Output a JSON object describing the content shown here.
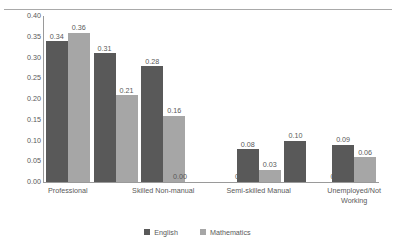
{
  "chart_data": {
    "type": "bar",
    "title": "",
    "subtitle": "",
    "xlabel": "",
    "ylabel": "",
    "ylim": [
      0.0,
      0.4
    ],
    "ytick_step": 0.05,
    "ytick_labels": [
      "0.40",
      "0.35",
      "0.30",
      "0.25",
      "0.20",
      "0.15",
      "0.10",
      "0.05",
      "0.00"
    ],
    "ytick_values": [
      0.4,
      0.35,
      0.3,
      0.25,
      0.2,
      0.15,
      0.1,
      0.05,
      0.0
    ],
    "grid": false,
    "legend_position": "bottom",
    "categories": [
      "Professional",
      "",
      "Skilled Non-manual",
      "",
      "Semi-skilled Manual",
      "",
      "Unemployed/Not Working"
    ],
    "axis_labels_shown": [
      {
        "text": "Professional",
        "lines": [
          "Professional"
        ]
      },
      {
        "text": "Skilled Non-manual",
        "lines": [
          "Skilled Non-manual"
        ]
      },
      {
        "text": "Semi-skilled Manual",
        "lines": [
          "Semi-skilled Manual"
        ]
      },
      {
        "text": "Unemployed/Not Working",
        "lines": [
          "Unemployed/Not",
          "Working"
        ]
      }
    ],
    "series": [
      {
        "name": "English",
        "color": "#595959",
        "values": [
          0.34,
          0.31,
          0.28,
          0.0,
          0.08,
          0.1,
          0.09
        ],
        "labels": [
          "0.34",
          "0.31",
          "0.28",
          "0.00",
          "0.08",
          "0.10",
          "0.09"
        ]
      },
      {
        "name": "Mathematics",
        "color": "#a6a6a6",
        "values": [
          0.36,
          0.21,
          0.16,
          0.0,
          0.03,
          0.0,
          0.06
        ],
        "labels": [
          "0.36",
          "0.21",
          "0.16",
          "0.00",
          "0.03",
          "0.00",
          "0.06"
        ]
      }
    ]
  },
  "legend": {
    "items": [
      {
        "label": "English",
        "swatch": "english-swatch-icon"
      },
      {
        "label": "Mathematics",
        "swatch": "mathematics-swatch-icon"
      }
    ]
  }
}
